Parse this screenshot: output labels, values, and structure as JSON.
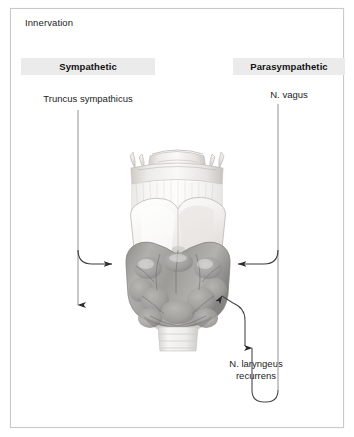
{
  "card": {
    "title": "Innervation"
  },
  "columns": {
    "sympathetic": {
      "heading": "Sympathetic",
      "nerve": "Truncus sympathicus"
    },
    "parasympathetic": {
      "heading": "Parasympathetic",
      "nerve": "N. vagus"
    }
  },
  "annotations": {
    "recurrens_line1": "N. laryngeus",
    "recurrens_line2": "recurrens"
  },
  "illustration": {
    "name": "larynx-thyroid-gland-anterior-view",
    "caption_absent": ""
  },
  "colors": {
    "band_background": "#ebebeb",
    "card_border": "#c9c9c9",
    "text": "#1c1c1c",
    "arrow": "#2b2b2b",
    "line": "#9a9a9a",
    "cartilage_light": "#f2f0ee",
    "cartilage_mid": "#dedbd7",
    "thyroid_gray": "#a9a7a4",
    "thyroid_dark": "#8a8885",
    "trachea": "#efeeec"
  }
}
